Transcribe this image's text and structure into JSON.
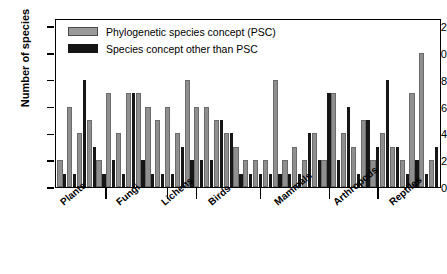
{
  "chart_data": {
    "type": "bar",
    "title": "",
    "xlabel": "",
    "ylabel": "Number of species",
    "ylim": [
      0,
      12.6
    ],
    "yticks": [
      0,
      2,
      4,
      6,
      8,
      10,
      12
    ],
    "ytick_labels": [
      "0",
      "2",
      "4",
      "6",
      "8",
      "10",
      "12"
    ],
    "grid": false,
    "legend_position": "top-left",
    "legend": [
      {
        "key": "psc",
        "label": "Phylogenetic species concept (PSC)",
        "color": "#8f8f8f"
      },
      {
        "key": "other",
        "label": "Species concept other than PSC",
        "color": "#161616"
      }
    ],
    "group_labels": [
      "Plants",
      "Fungi",
      "Lichens",
      "Birds",
      "Mammals",
      "Arthropods",
      "Reptiles"
    ],
    "group_boundaries_pct": [
      13.0,
      29.0,
      36.5,
      53.0,
      71.0,
      83.5
    ],
    "note": "Each adjacent pair of bars is one taxonomic study: gray = PSC count, black = non-PSC count",
    "bars": [
      {
        "series": "psc",
        "value": 2
      },
      {
        "series": "other",
        "value": 1
      },
      {
        "series": "psc",
        "value": 6
      },
      {
        "series": "other",
        "value": 1
      },
      {
        "series": "psc",
        "value": 4
      },
      {
        "series": "other",
        "value": 8
      },
      {
        "series": "psc",
        "value": 5
      },
      {
        "series": "other",
        "value": 3
      },
      {
        "series": "psc",
        "value": 2
      },
      {
        "series": "other",
        "value": 1
      },
      {
        "series": "psc",
        "value": 7
      },
      {
        "series": "other",
        "value": 2
      },
      {
        "series": "psc",
        "value": 4
      },
      {
        "series": "other",
        "value": 1
      },
      {
        "series": "psc",
        "value": 7
      },
      {
        "series": "other",
        "value": 7
      },
      {
        "series": "psc",
        "value": 7
      },
      {
        "series": "other",
        "value": 2
      },
      {
        "series": "psc",
        "value": 6
      },
      {
        "series": "other",
        "value": 1
      },
      {
        "series": "psc",
        "value": 5
      },
      {
        "series": "other",
        "value": 1
      },
      {
        "series": "psc",
        "value": 6
      },
      {
        "series": "other",
        "value": 1
      },
      {
        "series": "psc",
        "value": 4
      },
      {
        "series": "other",
        "value": 3
      },
      {
        "series": "psc",
        "value": 8
      },
      {
        "series": "other",
        "value": 2
      },
      {
        "series": "psc",
        "value": 6
      },
      {
        "series": "other",
        "value": 2
      },
      {
        "series": "psc",
        "value": 6
      },
      {
        "series": "other",
        "value": 2
      },
      {
        "series": "psc",
        "value": 5
      },
      {
        "series": "other",
        "value": 5
      },
      {
        "series": "psc",
        "value": 4
      },
      {
        "series": "other",
        "value": 4
      },
      {
        "series": "psc",
        "value": 3
      },
      {
        "series": "other",
        "value": 1
      },
      {
        "series": "psc",
        "value": 2
      },
      {
        "series": "other",
        "value": 1
      },
      {
        "series": "psc",
        "value": 2
      },
      {
        "series": "other",
        "value": 1
      },
      {
        "series": "psc",
        "value": 2
      },
      {
        "series": "other",
        "value": 1
      },
      {
        "series": "psc",
        "value": 8
      },
      {
        "series": "other",
        "value": 1
      },
      {
        "series": "psc",
        "value": 2
      },
      {
        "series": "other",
        "value": 1
      },
      {
        "series": "psc",
        "value": 3
      },
      {
        "series": "other",
        "value": 1
      },
      {
        "series": "psc",
        "value": 2
      },
      {
        "series": "other",
        "value": 4
      },
      {
        "series": "psc",
        "value": 4
      },
      {
        "series": "other",
        "value": 2
      },
      {
        "series": "psc",
        "value": 2
      },
      {
        "series": "other",
        "value": 7
      },
      {
        "series": "psc",
        "value": 7
      },
      {
        "series": "other",
        "value": 2
      },
      {
        "series": "psc",
        "value": 4
      },
      {
        "series": "other",
        "value": 6
      },
      {
        "series": "psc",
        "value": 3
      },
      {
        "series": "other",
        "value": 1
      },
      {
        "series": "psc",
        "value": 5
      },
      {
        "series": "other",
        "value": 5
      },
      {
        "series": "psc",
        "value": 2
      },
      {
        "series": "other",
        "value": 3
      },
      {
        "series": "psc",
        "value": 4
      },
      {
        "series": "other",
        "value": 8
      },
      {
        "series": "psc",
        "value": 3
      },
      {
        "series": "other",
        "value": 3
      },
      {
        "series": "psc",
        "value": 2
      },
      {
        "series": "other",
        "value": 1
      },
      {
        "series": "psc",
        "value": 7
      },
      {
        "series": "other",
        "value": 2
      },
      {
        "series": "psc",
        "value": 10
      },
      {
        "series": "other",
        "value": 1
      },
      {
        "series": "psc",
        "value": 2
      },
      {
        "series": "other",
        "value": 3
      }
    ]
  }
}
